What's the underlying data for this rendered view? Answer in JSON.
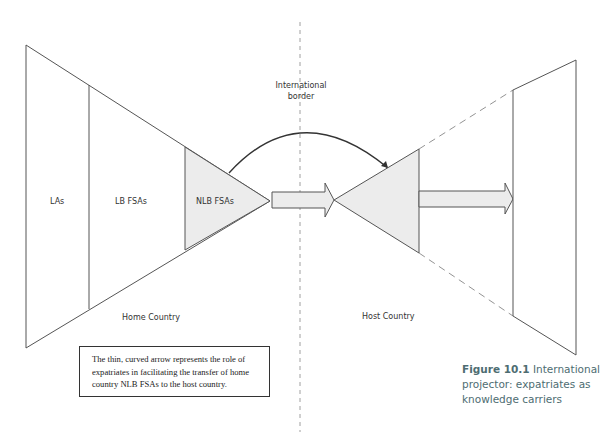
{
  "diagram": {
    "labels": {
      "las": "LAs",
      "lb_fsas": "LB FSAs",
      "nlb_fsas": "NLB FSAs",
      "international_border_line1": "International",
      "international_border_line2": "border",
      "home_country": "Home Country",
      "host_country": "Host Country"
    },
    "note": "The thin, curved arrow represents the role of expatriates in facilitating the transfer of home country NLB FSAs to the host country.",
    "caption": {
      "number": "Figure 10.1",
      "text": "International projector: expatriates as knowledge carriers"
    },
    "colors": {
      "line": "#555555",
      "fill": "#ececec",
      "caption": "#4e6d72"
    }
  }
}
